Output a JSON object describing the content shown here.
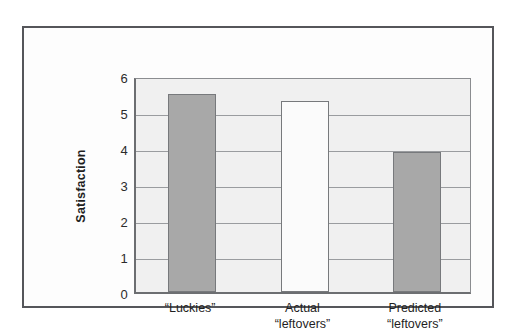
{
  "chart_data": {
    "type": "bar",
    "title": "",
    "xlabel": "",
    "ylabel": "Satisfaction",
    "categories": [
      "“Luckies”",
      "Actual\n“leftovers”",
      "Predicted\n“leftovers”"
    ],
    "values": [
      5.5,
      5.3,
      3.9
    ],
    "ylim": [
      0,
      6
    ],
    "yticks": [
      "0",
      "1",
      "2",
      "3",
      "4",
      "5",
      "6"
    ],
    "grid": true,
    "legend": "none",
    "bar_styles": [
      "filled",
      "unfilled",
      "filled"
    ],
    "colors": {
      "bar_filled": "#a8a8a8",
      "bar_unfilled": "#fbfbfb",
      "bar_border": "#77797c",
      "plot_background": "#f0f0f0",
      "gridline": "#9a9c9f",
      "axis": "#6c6e71",
      "frame_border": "#55565a",
      "page_background": "#ffffff",
      "text": "#1f1f1f"
    }
  },
  "axis": {
    "y_title": "Satisfaction"
  }
}
